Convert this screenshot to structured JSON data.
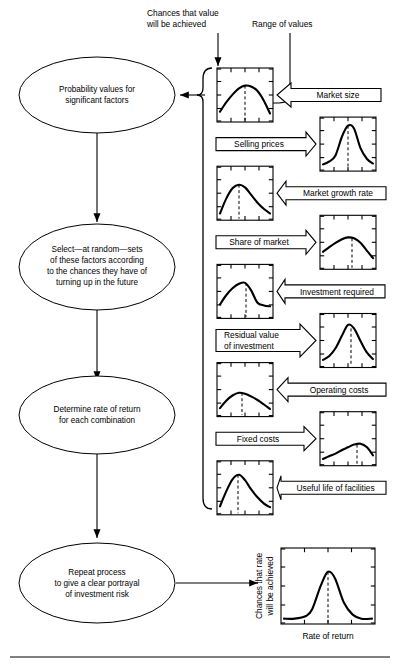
{
  "diagram": {
    "annotations": [
      {
        "id": "chances-value",
        "line1": "Chances that value",
        "line2": "will be achieved"
      },
      {
        "id": "range-of-values",
        "line1": "Range of values",
        "line2": ""
      }
    ],
    "ev_label": "E.V.",
    "nodes": [
      {
        "id": "probability-values",
        "lines": [
          "Probability values for",
          "significant factors"
        ]
      },
      {
        "id": "select-at-random",
        "lines": [
          "Select—at random—sets",
          "of these factors according",
          "to the chances they have of",
          "turning up in the future"
        ]
      },
      {
        "id": "determine-rate",
        "lines": [
          "Determine rate of return",
          "for each combination"
        ]
      },
      {
        "id": "repeat-process",
        "lines": [
          "Repeat process",
          "to give a clear portrayal",
          "of investment risk"
        ]
      }
    ],
    "factors": [
      {
        "id": "market-size",
        "label": "Market size",
        "lines": [
          "Market size"
        ],
        "chart_side": "left",
        "arrow_dir": "left"
      },
      {
        "id": "selling-prices",
        "label": "Selling prices",
        "lines": [
          "Selling prices"
        ],
        "chart_side": "right",
        "arrow_dir": "right"
      },
      {
        "id": "market-growth-rate",
        "label": "Market growth rate",
        "lines": [
          "Market growth rate"
        ],
        "chart_side": "left",
        "arrow_dir": "left"
      },
      {
        "id": "share-of-market",
        "label": "Share of market",
        "lines": [
          "Share of market"
        ],
        "chart_side": "right",
        "arrow_dir": "right"
      },
      {
        "id": "investment-required",
        "label": "Investment required",
        "lines": [
          "Investment required"
        ],
        "chart_side": "left",
        "arrow_dir": "left"
      },
      {
        "id": "residual-value",
        "label": "Residual value of investment",
        "lines": [
          "Residual value",
          "of investment"
        ],
        "chart_side": "right",
        "arrow_dir": "right"
      },
      {
        "id": "operating-costs",
        "label": "Operating costs",
        "lines": [
          "Operating costs"
        ],
        "chart_side": "left",
        "arrow_dir": "left"
      },
      {
        "id": "fixed-costs",
        "label": "Fixed costs",
        "lines": [
          "Fixed costs"
        ],
        "chart_side": "right",
        "arrow_dir": "right"
      },
      {
        "id": "useful-life",
        "label": "Useful life of facilities",
        "lines": [
          "Useful life of facilities"
        ],
        "chart_side": "left",
        "arrow_dir": "left"
      }
    ],
    "result_chart": {
      "id": "rate-of-return-distribution",
      "ylabel_line1": "Chances that rate",
      "ylabel_line2": "will be achieved",
      "xlabel": "Rate of return"
    },
    "colors": {
      "ink": "#000000",
      "paper": "#ffffff"
    }
  },
  "chart_data": [
    {
      "type": "line",
      "id": "market-size",
      "title": "Market size",
      "xlabel": "Range of values",
      "ylabel": "Chances that value will be achieved",
      "ev_marker": 0.5,
      "shape": "broad-symmetric",
      "x": [
        0,
        0.12,
        0.25,
        0.38,
        0.5,
        0.62,
        0.75,
        0.88,
        1
      ],
      "y": [
        0.14,
        0.34,
        0.52,
        0.66,
        0.72,
        0.7,
        0.6,
        0.38,
        0.1
      ]
    },
    {
      "type": "line",
      "id": "selling-prices",
      "title": "Selling prices",
      "xlabel": "Range of values",
      "ylabel": "Chances that value will be achieved",
      "ev_marker": 0.5,
      "shape": "tall-narrow-peak",
      "x": [
        0,
        0.12,
        0.25,
        0.38,
        0.5,
        0.62,
        0.75,
        0.88,
        1
      ],
      "y": [
        0.06,
        0.12,
        0.26,
        0.68,
        0.92,
        0.86,
        0.42,
        0.18,
        0.08
      ]
    },
    {
      "type": "line",
      "id": "market-growth-rate",
      "title": "Market growth rate",
      "xlabel": "Range of values",
      "ylabel": "Chances that value will be achieved",
      "ev_marker": 0.38,
      "shape": "left-skewed-peak",
      "x": [
        0,
        0.12,
        0.25,
        0.38,
        0.5,
        0.62,
        0.75,
        0.88,
        1
      ],
      "y": [
        0.06,
        0.38,
        0.62,
        0.7,
        0.64,
        0.48,
        0.3,
        0.16,
        0.06
      ]
    },
    {
      "type": "line",
      "id": "share-of-market",
      "title": "Share of market",
      "xlabel": "Range of values",
      "ylabel": "Chances that value will be achieved",
      "ev_marker": 0.58,
      "shape": "broad-right-peak",
      "x": [
        0,
        0.12,
        0.25,
        0.38,
        0.5,
        0.62,
        0.75,
        0.88,
        1
      ],
      "y": [
        0.3,
        0.4,
        0.5,
        0.58,
        0.62,
        0.6,
        0.5,
        0.32,
        0.16
      ]
    },
    {
      "type": "line",
      "id": "investment-required",
      "title": "Investment required",
      "xlabel": "Range of values",
      "ylabel": "Chances that value will be achieved",
      "ev_marker": 0.52,
      "shape": "rise-then-sharp-drop",
      "x": [
        0,
        0.12,
        0.25,
        0.38,
        0.5,
        0.62,
        0.75,
        0.88,
        1
      ],
      "y": [
        0.22,
        0.42,
        0.58,
        0.68,
        0.7,
        0.54,
        0.26,
        0.2,
        0.18
      ]
    },
    {
      "type": "line",
      "id": "residual-value",
      "title": "Residual value of investment",
      "xlabel": "Range of values",
      "ylabel": "Chances that value will be achieved",
      "ev_marker": 0.56,
      "shape": "tall-peak-right",
      "x": [
        0,
        0.12,
        0.25,
        0.38,
        0.5,
        0.62,
        0.75,
        0.88,
        1
      ],
      "y": [
        0.08,
        0.16,
        0.34,
        0.62,
        0.86,
        0.78,
        0.5,
        0.24,
        0.1
      ]
    },
    {
      "type": "line",
      "id": "operating-costs",
      "title": "Operating costs",
      "xlabel": "Range of values",
      "ylabel": "Chances that value will be achieved",
      "ev_marker": 0.44,
      "shape": "low-flat-arc",
      "x": [
        0,
        0.12,
        0.25,
        0.38,
        0.5,
        0.62,
        0.75,
        0.88,
        1
      ],
      "y": [
        0.1,
        0.26,
        0.38,
        0.44,
        0.42,
        0.36,
        0.28,
        0.18,
        0.08
      ]
    },
    {
      "type": "line",
      "id": "fixed-costs",
      "title": "Fixed costs",
      "xlabel": "Range of values",
      "ylabel": "Chances that value will be achieved",
      "ev_marker": 0.68,
      "shape": "low-rising-right",
      "x": [
        0,
        0.12,
        0.25,
        0.38,
        0.5,
        0.62,
        0.75,
        0.88,
        1
      ],
      "y": [
        0.06,
        0.12,
        0.18,
        0.26,
        0.32,
        0.38,
        0.4,
        0.32,
        0.14
      ]
    },
    {
      "type": "line",
      "id": "useful-life",
      "title": "Useful life of facilities",
      "xlabel": "Range of values",
      "ylabel": "Chances that value will be achieved",
      "ev_marker": 0.36,
      "shape": "peak-left-of-center",
      "x": [
        0,
        0.12,
        0.25,
        0.38,
        0.5,
        0.62,
        0.75,
        0.88,
        1
      ],
      "y": [
        0.1,
        0.42,
        0.7,
        0.8,
        0.68,
        0.48,
        0.3,
        0.16,
        0.08
      ]
    },
    {
      "type": "line",
      "id": "rate-of-return-distribution",
      "title": "Rate of return distribution",
      "xlabel": "Rate of return",
      "ylabel": "Chances that rate will be achieved",
      "ev_marker": 0.5,
      "shape": "sharp-narrow-peak",
      "x": [
        0,
        0.12,
        0.25,
        0.32,
        0.42,
        0.5,
        0.58,
        0.68,
        0.78,
        0.88,
        1
      ],
      "y": [
        0.02,
        0.02,
        0.06,
        0.16,
        0.52,
        0.72,
        0.62,
        0.26,
        0.08,
        0.02,
        0.02
      ]
    }
  ]
}
